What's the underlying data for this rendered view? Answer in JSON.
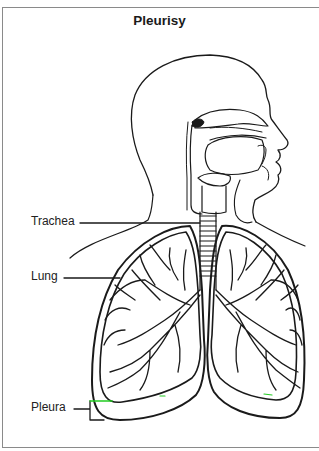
{
  "diagram": {
    "title": "Pleurisy",
    "labels": [
      {
        "id": "trachea",
        "text": "Trachea"
      },
      {
        "id": "lung",
        "text": "Lung"
      },
      {
        "id": "pleura",
        "text": "Pleura"
      }
    ],
    "colors": {
      "line": "#1a1a1a",
      "frame": "#8a8a8a",
      "pleura_highlight": "#22cc22"
    }
  }
}
